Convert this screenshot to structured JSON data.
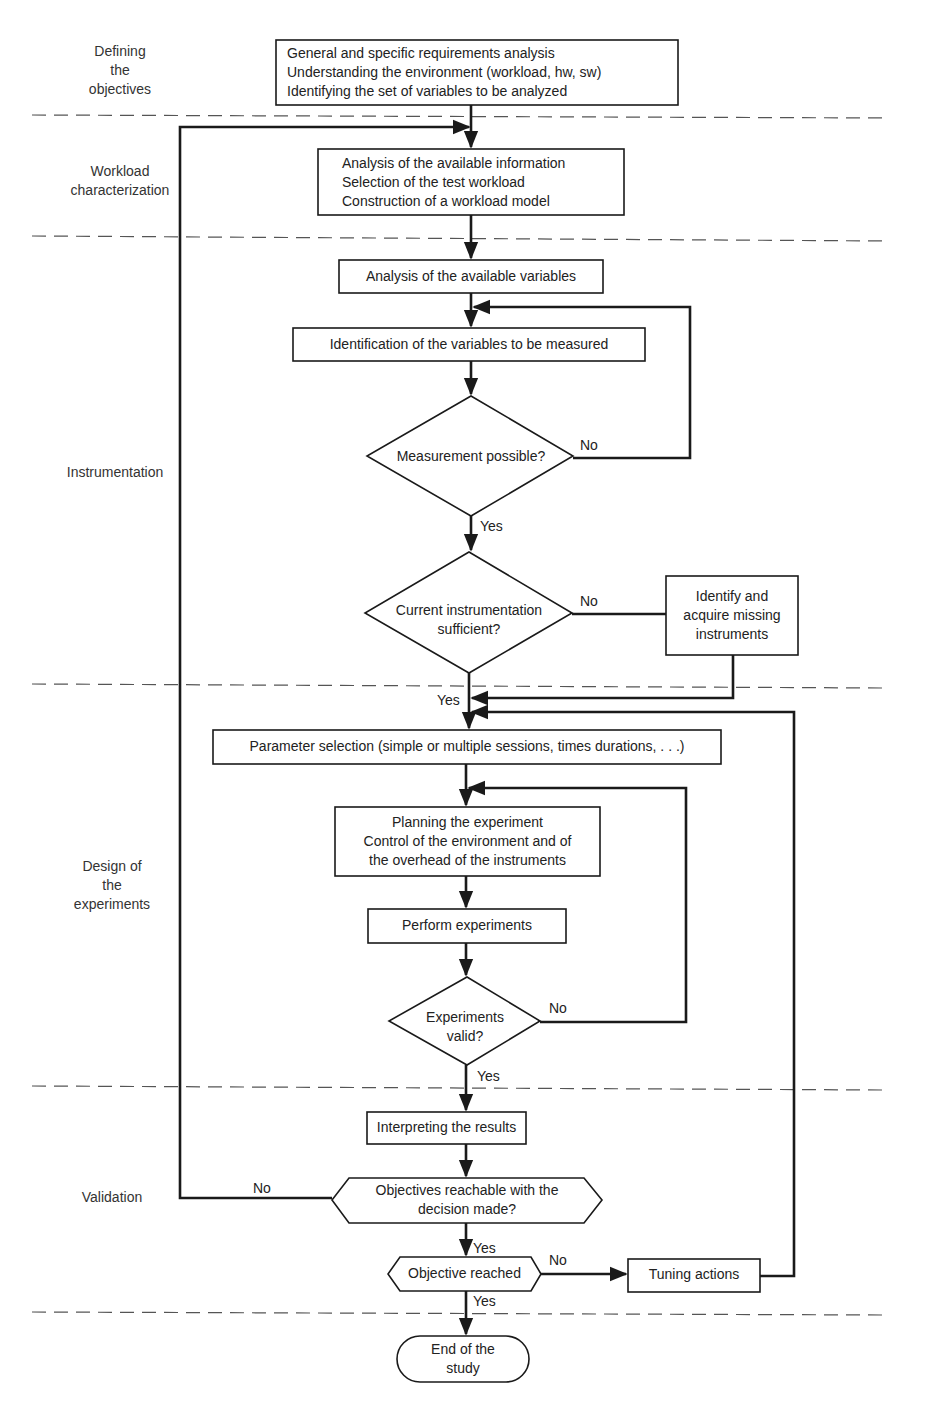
{
  "phases": [
    {
      "id": "defining",
      "label": [
        "Defining",
        "the",
        "objectives"
      ]
    },
    {
      "id": "workload",
      "label": [
        "Workload",
        "characterization"
      ]
    },
    {
      "id": "instrumentation",
      "label": [
        "Instrumentation"
      ]
    },
    {
      "id": "design",
      "label": [
        "Design of",
        "the",
        "experiments"
      ]
    },
    {
      "id": "validation",
      "label": [
        "Validation"
      ]
    }
  ],
  "nodes": {
    "requirements": {
      "type": "process",
      "lines": [
        "General and specific requirements analysis",
        "Understanding the environment (workload, hw, sw)",
        "Identifying the set of variables to be analyzed"
      ]
    },
    "workload_model": {
      "type": "process",
      "lines": [
        "Analysis of the available information",
        "Selection of the test workload",
        "Construction of a workload model"
      ]
    },
    "available_vars": {
      "type": "process",
      "lines": [
        "Analysis of the available variables"
      ]
    },
    "identify_vars": {
      "type": "process",
      "lines": [
        "Identification of the variables to be measured"
      ]
    },
    "measurement_possible": {
      "type": "decision",
      "lines": [
        "Measurement possible?"
      ]
    },
    "instrumentation_sufficient": {
      "type": "decision",
      "lines": [
        "Current instrumentation",
        "sufficient?"
      ]
    },
    "acquire_instruments": {
      "type": "process",
      "lines": [
        "Identify and",
        "acquire missing",
        "instruments"
      ]
    },
    "parameter_selection": {
      "type": "process",
      "lines": [
        "Parameter selection (simple or multiple sessions, times durations, . . .)"
      ]
    },
    "planning": {
      "type": "process",
      "lines": [
        "Planning the experiment",
        "Control of the environment and of",
        "the overhead of the instruments"
      ]
    },
    "perform": {
      "type": "process",
      "lines": [
        "Perform experiments"
      ]
    },
    "experiments_valid": {
      "type": "decision",
      "lines": [
        "Experiments",
        "valid?"
      ]
    },
    "interpreting": {
      "type": "process",
      "lines": [
        "Interpreting the results"
      ]
    },
    "objectives_reachable": {
      "type": "hex-decision",
      "lines": [
        "Objectives reachable with the",
        "decision made?"
      ]
    },
    "objective_reached": {
      "type": "hex-decision",
      "lines": [
        "Objective reached"
      ]
    },
    "tuning": {
      "type": "process",
      "lines": [
        "Tuning actions"
      ]
    },
    "end": {
      "type": "terminal",
      "lines": [
        "End of the",
        "study"
      ]
    }
  },
  "edge_labels": {
    "yes": "Yes",
    "no": "No"
  }
}
